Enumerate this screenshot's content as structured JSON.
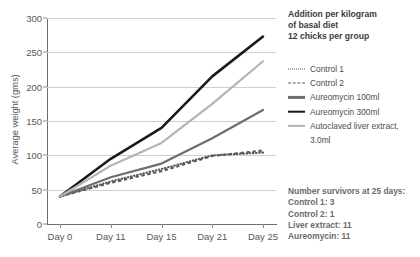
{
  "panel": {
    "title_lines": [
      "Addition per kilogram",
      "of basal diet",
      "12 chicks per group"
    ],
    "survivors_lines": [
      "Number survivors at 25 days:",
      "Control 1: 3",
      "Control 2: 1",
      "Liver extract: 11",
      "Aureomycin: 11"
    ]
  },
  "chart_data": {
    "type": "line",
    "title": "",
    "xlabel": "",
    "ylabel": "Average weight (gms)",
    "categories": [
      "Day 0",
      "Day 11",
      "Day 15",
      "Day 21",
      "Day 25"
    ],
    "ylim": [
      0,
      300
    ],
    "yticks": [
      0,
      50,
      100,
      150,
      200,
      250,
      300
    ],
    "grid": true,
    "legend_position": "right",
    "series": [
      {
        "name": "Control 1",
        "values": [
          40,
          62,
          80,
          100,
          104
        ],
        "style": "dotted",
        "color": "#58585a",
        "width": 2.1
      },
      {
        "name": "Control 2",
        "values": [
          40,
          60,
          77,
          99,
          107
        ],
        "style": "dashed",
        "color": "#58585a",
        "width": 2.1
      },
      {
        "name": "Aureomycin 100ml",
        "values": [
          40,
          68,
          88,
          125,
          166
        ],
        "style": "solid",
        "color": "#6e6e70",
        "width": 2.2
      },
      {
        "name": "Aureomycin 300ml",
        "values": [
          40,
          95,
          140,
          215,
          273
        ],
        "style": "solid",
        "color": "#1a1a1a",
        "width": 2.6
      },
      {
        "name": "Autoclaved liver extract, 3.0ml",
        "values": [
          40,
          85,
          118,
          175,
          237
        ],
        "style": "solid",
        "color": "#b4b4b6",
        "width": 2.2
      }
    ],
    "legend_entries": [
      "Control 1",
      "Control 2",
      "Aureomycin 100ml",
      "Aureomycin 300ml",
      "Autoclaved liver extract,"
    ],
    "legend_entry_extra": "3.0ml"
  }
}
